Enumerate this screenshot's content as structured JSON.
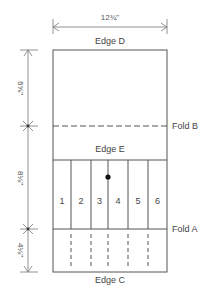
{
  "diagram": {
    "width_dimension": "12¾\"",
    "height_dimensions": {
      "top": "6⅝\"",
      "middle": "8⅛\"",
      "bottom": "4⅛\""
    },
    "edges": {
      "top": "Edge D",
      "inner": "Edge E",
      "bottom": "Edge C"
    },
    "folds": {
      "a": "Fold A",
      "b": "Fold B"
    },
    "panels": [
      "1",
      "2",
      "3",
      "4",
      "5",
      "6"
    ],
    "colors": {
      "line": "#555555",
      "text": "#444444",
      "dot": "#111111"
    }
  }
}
